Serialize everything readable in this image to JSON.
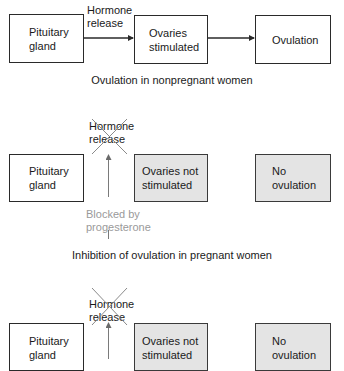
{
  "colors": {
    "line": "#2a2a2a",
    "box_fill_inactive": "#e4e4e4",
    "blocked_text": "#9a9a9a",
    "cross": "#8a8a8a"
  },
  "panel_1": {
    "caption": "Ovulation in nonpregnant women",
    "boxes": [
      {
        "label": "Pituitary\ngland",
        "state": "active"
      },
      {
        "label": "Ovaries\nstimulated",
        "state": "active"
      },
      {
        "label": "Ovulation",
        "state": "active"
      }
    ],
    "arrow_label": "Hormone\nrelease"
  },
  "panel_2": {
    "caption": "Inhibition of ovulation in pregnant women",
    "boxes": [
      {
        "label": "Pituitary\ngland",
        "state": "active"
      },
      {
        "label": "Ovaries not\nstimulated",
        "state": "inactive"
      },
      {
        "label": "No\novulation",
        "state": "inactive"
      }
    ],
    "crossed_label": "Hormone\nrelease",
    "blocker_label": "Blocked by\nprogesterone"
  },
  "panel_3": {
    "boxes": [
      {
        "label": "Pituitary\ngland",
        "state": "active"
      },
      {
        "label": "Ovaries not\nstimulated",
        "state": "inactive"
      },
      {
        "label": "No\novulation",
        "state": "inactive"
      }
    ],
    "crossed_label": "Hormone\nrelease"
  }
}
